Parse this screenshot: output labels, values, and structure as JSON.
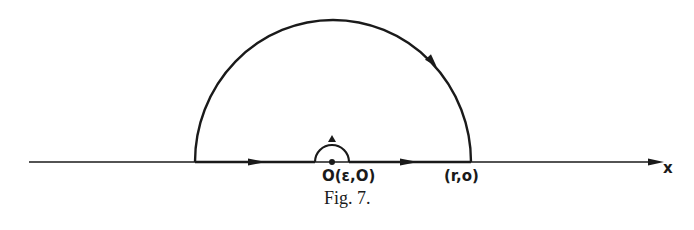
{
  "figure": {
    "caption": "Fig. 7.",
    "axis_label": "x",
    "points": [
      {
        "id": "origin",
        "label": "O(ε,O)"
      },
      {
        "id": "r",
        "label": "(r,o)"
      }
    ],
    "contour": {
      "description": "Indented semicircular contour in the upper half-plane",
      "segments": [
        "real axis from (-r,0) to (-ε,0)",
        "small semicircle of radius ε around origin",
        "real axis from (ε,0) to (r,0)",
        "large semicircle of radius r back to (-r,0)"
      ]
    },
    "colors": {
      "ink": "#1a1a1a",
      "background": "#ffffff"
    }
  }
}
